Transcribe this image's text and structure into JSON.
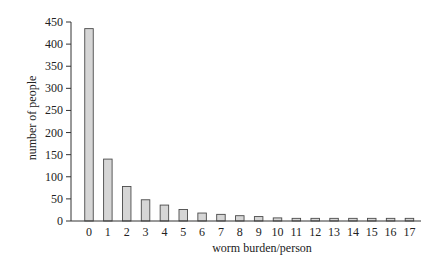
{
  "chart_data": {
    "type": "bar",
    "title": "",
    "xlabel": "worm burden/person",
    "ylabel": "number of people",
    "categories": [
      "0",
      "1",
      "2",
      "3",
      "4",
      "5",
      "6",
      "7",
      "8",
      "9",
      "10",
      "11",
      "12",
      "13",
      "14",
      "15",
      "16",
      "17"
    ],
    "values": [
      435,
      140,
      78,
      48,
      36,
      26,
      18,
      15,
      12,
      10,
      7,
      6,
      6,
      6,
      6,
      6,
      6,
      6
    ],
    "ylim": [
      0,
      450
    ],
    "yticks": [
      0,
      50,
      100,
      150,
      200,
      250,
      300,
      350,
      400,
      450
    ],
    "grid": false,
    "legend": null,
    "colors": {
      "bar_fill": "#d6d6d6",
      "bar_stroke": "#4a4a4a",
      "axis": "#333333"
    }
  }
}
